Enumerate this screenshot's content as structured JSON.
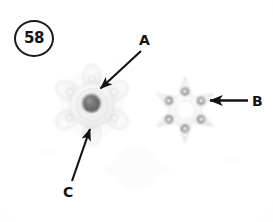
{
  "figure": {
    "number": "58",
    "badge_shape": "circle",
    "plate_background": "#fefefe",
    "ink_color": "#121212"
  },
  "callouts": [
    {
      "id": "A",
      "label": "A",
      "label_x": 145,
      "label_y": 40,
      "arrow_from_x": 140,
      "arrow_from_y": 50,
      "arrow_to_x": 100,
      "arrow_to_y": 88,
      "direction": "down-left",
      "points_to": "hub-flange-assembly"
    },
    {
      "id": "B",
      "label": "B",
      "label_x": 258,
      "label_y": 101,
      "arrow_from_x": 247,
      "arrow_from_y": 101,
      "arrow_to_x": 210,
      "arrow_to_y": 101,
      "direction": "left",
      "points_to": "six-point-star-plate"
    },
    {
      "id": "C",
      "label": "C",
      "label_x": 69,
      "label_y": 192,
      "arrow_from_x": 72,
      "arrow_from_y": 180,
      "arrow_to_x": 90,
      "arrow_to_y": 129,
      "direction": "up-right",
      "points_to": "star-flange-lobe"
    }
  ],
  "parts": [
    {
      "id": "hub-flange-assembly",
      "name": "lobed flange with dark center hub",
      "center_x": 92,
      "center_y": 105,
      "lobes": 6,
      "outer_radius": 34,
      "hub_radius": 10,
      "hub_color": "#6f6f6f",
      "body_color": "#f2f2f2",
      "edge_color": "#d8d8d8"
    },
    {
      "id": "six-point-star-plate",
      "name": "six-point star plate with six grommet holes",
      "center_x": 185,
      "center_y": 110,
      "points": 6,
      "holes": 6,
      "outer_radius": 33,
      "inner_radius": 15,
      "hole_ring_radius": 19,
      "hole_radius": 4,
      "hole_color": "#8d8d8d",
      "body_color": "#f4f4f4",
      "edge_color": "#dcdcdc"
    },
    {
      "id": "faint-retainer-washer",
      "name": "faint round retainer with side tabs",
      "center_x": 137,
      "center_y": 168,
      "outer_radius": 22,
      "tabs": 2,
      "body_color": "#fcfcfc",
      "edge_color": "#f1f1f1"
    }
  ]
}
